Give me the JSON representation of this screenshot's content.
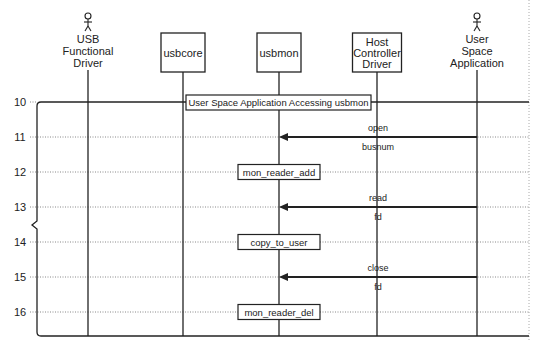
{
  "participants": [
    {
      "id": "usb-functional-driver",
      "kind": "actor",
      "lines": [
        "USB",
        "Functional",
        "Driver"
      ],
      "x": 88
    },
    {
      "id": "usbcore",
      "kind": "box",
      "lines": [
        "usbcore"
      ],
      "x": 183
    },
    {
      "id": "usbmon",
      "kind": "box",
      "lines": [
        "usbmon"
      ],
      "x": 279
    },
    {
      "id": "host-controller-driver",
      "kind": "box",
      "lines": [
        "Host",
        "Controller",
        "Driver"
      ],
      "x": 377
    },
    {
      "id": "user-space-application",
      "kind": "actor",
      "lines": [
        "User",
        "Space",
        "Application"
      ],
      "x": 477
    }
  ],
  "rows": [
    {
      "label": "10",
      "y": 102
    },
    {
      "label": "11",
      "y": 137
    },
    {
      "label": "12",
      "y": 172
    },
    {
      "label": "13",
      "y": 207
    },
    {
      "label": "14",
      "y": 242
    },
    {
      "label": "15",
      "y": 277
    },
    {
      "label": "16",
      "y": 312
    }
  ],
  "frame": {
    "title": "User Space Application Accessing usbmon"
  },
  "messages": [
    {
      "from": "user-space-application",
      "to": "usbmon",
      "y": 137,
      "above": "open",
      "below": "busnum"
    },
    {
      "from": "user-space-application",
      "to": "usbmon",
      "y": 207,
      "above": "read",
      "below": "fd"
    },
    {
      "from": "user-space-application",
      "to": "usbmon",
      "y": 277,
      "above": "close",
      "below": "fd"
    }
  ],
  "actions": [
    {
      "on": "usbmon",
      "y": 172,
      "label": "mon_reader_add"
    },
    {
      "on": "usbmon",
      "y": 242,
      "label": "copy_to_user"
    },
    {
      "on": "usbmon",
      "y": 312,
      "label": "mon_reader_del"
    }
  ],
  "colors": {
    "line": "#222222",
    "grid": "#888888",
    "background": "#ffffff"
  }
}
